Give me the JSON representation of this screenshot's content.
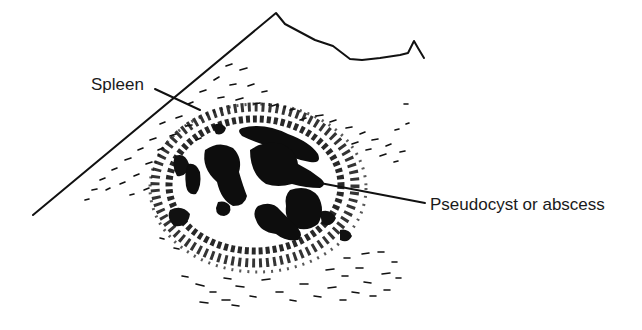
{
  "figure": {
    "type": "ultrasound-line-drawing",
    "colors": {
      "ink": "#111111",
      "background": "#ffffff"
    }
  },
  "labels": {
    "spleen": {
      "text": "Spleen",
      "x": 91,
      "y": 76
    },
    "lesion": {
      "text": "Pseudocyst or abscess",
      "x": 430,
      "y": 198
    }
  }
}
